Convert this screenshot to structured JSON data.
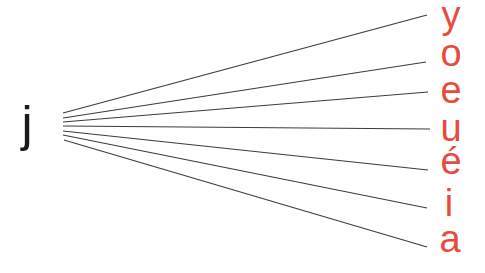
{
  "diagram": {
    "source_letter": "j",
    "target_letters": [
      "y",
      "o",
      "e",
      "u",
      "é",
      "i",
      "a"
    ],
    "colors": {
      "source_text": "#1a1a1a",
      "target_text": "#e84a3f",
      "line": "#3c3c3c",
      "background": "#ffffff"
    }
  }
}
